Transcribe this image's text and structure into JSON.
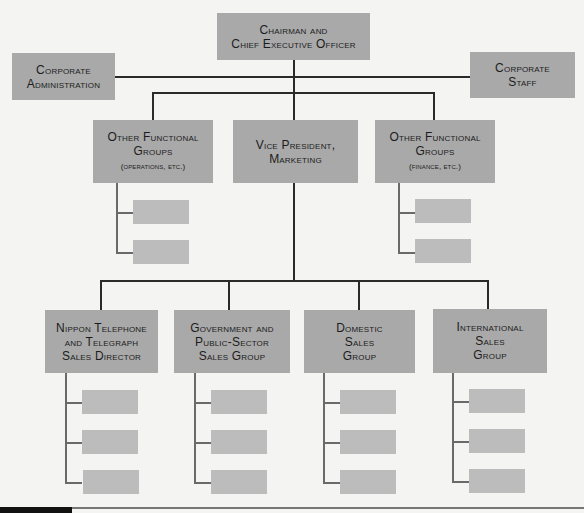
{
  "chart": {
    "type": "org-chart",
    "top": {
      "line1": "Chairman and",
      "line2": "Chief Executive Officer"
    },
    "staff_left": {
      "line1": "Corporate",
      "line2": "Administration"
    },
    "staff_right": {
      "line1": "Corporate",
      "line2": "Staff"
    },
    "tier2": [
      {
        "line1": "Other Functional",
        "line2": "Groups",
        "note": "(operations, etc.)",
        "sub_units": 2
      },
      {
        "line1": "Vice President,",
        "line2": "Marketing",
        "note": ""
      },
      {
        "line1": "Other Functional",
        "line2": "Groups",
        "note": "(finance, etc.)",
        "sub_units": 2
      }
    ],
    "tier3": [
      {
        "line1": "Nippon Telephone",
        "line2": "and Telegraph",
        "line3": "Sales Director",
        "sub_units": 3
      },
      {
        "line1": "Government and",
        "line2": "Public-Sector",
        "line3": "Sales Group",
        "sub_units": 3
      },
      {
        "line1": "Domestic",
        "line2": "Sales",
        "line3": "Group",
        "sub_units": 3
      },
      {
        "line1": "International",
        "line2": "Sales",
        "line3": "Group",
        "sub_units": 3
      }
    ],
    "colors": {
      "box": "#a9a9a9",
      "sub_box": "#bcbcbc",
      "line": "#2a2a2a",
      "background": "#f4f4f2"
    }
  }
}
